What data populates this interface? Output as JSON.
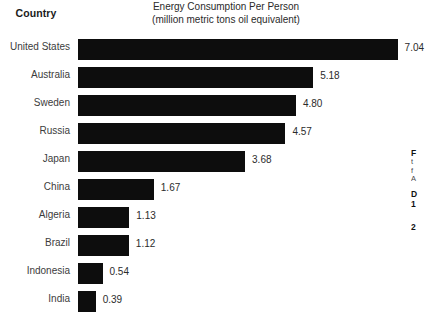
{
  "header": {
    "country_label": "Country",
    "title_line1": "Energy Consumption Per Person",
    "title_line2": "(million metric tons oil equivalent)"
  },
  "chart_data": {
    "type": "bar",
    "orientation": "horizontal",
    "title": "Energy Consumption Per Person (million metric tons oil equivalent)",
    "xlabel": "million metric tons oil equivalent",
    "ylabel": "Country",
    "grid": false,
    "legend": "none",
    "xlim": [
      0,
      7.04
    ],
    "bar_color": "#0d0d0d",
    "categories": [
      "United States",
      "Australia",
      "Sweden",
      "Russia",
      "Japan",
      "China",
      "Algeria",
      "Brazil",
      "Indonesia",
      "India"
    ],
    "values": [
      7.04,
      5.18,
      4.8,
      4.57,
      3.68,
      1.67,
      1.13,
      1.12,
      0.54,
      0.39
    ],
    "value_labels": [
      "7.04",
      "5.18",
      "4.80",
      "4.57",
      "3.68",
      "1.67",
      "1.13",
      "1.12",
      "0.54",
      "0.39"
    ]
  },
  "side_note": {
    "heading1": "F",
    "line1": "t",
    "line2": "f",
    "line3": "A",
    "heading2": "D",
    "item1": "1",
    "item2": "2"
  }
}
